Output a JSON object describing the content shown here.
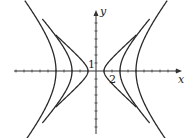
{
  "chart_data": {
    "type": "line",
    "title": "",
    "xlabel": "x",
    "ylabel": "y",
    "tick_labels": {
      "x": [
        "2"
      ],
      "y": [
        "1"
      ]
    },
    "grid": false,
    "series": [
      {
        "name": "k=1",
        "a": 1
      },
      {
        "name": "k=9",
        "a": 3
      },
      {
        "name": "k=25",
        "a": 5
      }
    ],
    "xlim": [
      -11,
      11
    ],
    "ylim": [
      -8.5,
      8.5
    ]
  },
  "labels": {
    "x": "x",
    "y": "y",
    "one": "1",
    "two": "2"
  },
  "colors": {
    "curve": "#2a2a2a",
    "axis": "#333333"
  }
}
